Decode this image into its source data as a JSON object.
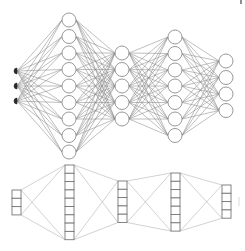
{
  "diagram": {
    "type": "neural-network-architecture",
    "colors": {
      "background": "#ffffff",
      "node_stroke": "#8c8c8c",
      "edge": "#8a8a8a",
      "input_fill": "#2a2a2a",
      "block_edge": "#b4b4b4",
      "cell_stroke": "#777777"
    },
    "top_network": {
      "layers": [
        {
          "name": "input",
          "x": 15,
          "units": 3,
          "ys": [
            71,
            86,
            101
          ],
          "style": "filled-dot"
        },
        {
          "name": "hidden-1",
          "x": 69,
          "units": 9,
          "ys": [
            20,
            36.5,
            53,
            69.5,
            86,
            102.5,
            119,
            135.5,
            152
          ],
          "style": "circle"
        },
        {
          "name": "hidden-2",
          "x": 122,
          "units": 5,
          "ys": [
            53,
            69.5,
            86,
            102.5,
            119
          ],
          "style": "circle"
        },
        {
          "name": "hidden-3",
          "x": 175,
          "units": 7,
          "ys": [
            37,
            53.5,
            70,
            86,
            102.5,
            119,
            135.5
          ],
          "style": "circle"
        },
        {
          "name": "output",
          "x": 226,
          "units": 4,
          "ys": [
            61,
            77.5,
            94,
            110.5
          ],
          "style": "circle"
        }
      ],
      "node_radius": 7,
      "connectivity": "fully-connected"
    },
    "bottom_blocks": {
      "blocks": [
        {
          "name": "input-block",
          "x": 12,
          "y": 190,
          "w": 9,
          "cells": 3,
          "cell_h": 8.3
        },
        {
          "name": "hidden-1-block",
          "x": 65,
          "y": 165,
          "w": 9,
          "cells": 9,
          "cell_h": 8.3
        },
        {
          "name": "hidden-2-block",
          "x": 118,
          "y": 181,
          "w": 9,
          "cells": 5,
          "cell_h": 8.3
        },
        {
          "name": "hidden-3-block",
          "x": 171,
          "y": 173,
          "w": 9,
          "cells": 7,
          "cell_h": 8.3
        },
        {
          "name": "output-block",
          "x": 222,
          "y": 185,
          "w": 9,
          "cells": 4,
          "cell_h": 8.3
        }
      ],
      "connectivity": "corner-to-corner crossed lines"
    }
  }
}
